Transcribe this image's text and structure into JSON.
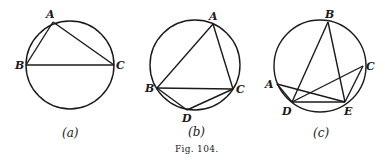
{
  "figure": {
    "caption": "Fig. 104.",
    "panels": [
      {
        "id": "a",
        "sublabel": "(a)",
        "circle": {
          "cx": 70,
          "cy": 65,
          "r": 44
        },
        "points": {
          "A": [
            53,
            22
          ],
          "B": [
            26,
            65
          ],
          "C": [
            114,
            65
          ]
        },
        "labels": {
          "A": "A",
          "B": "B",
          "C": "C"
        },
        "segments": [
          [
            "A",
            "B"
          ],
          [
            "A",
            "C"
          ],
          [
            "B",
            "C"
          ]
        ]
      },
      {
        "id": "b",
        "sublabel": "(b)",
        "circle": {
          "cx": 195,
          "cy": 65,
          "r": 45
        },
        "points": {
          "A": [
            213,
            24
          ],
          "B": [
            157,
            88
          ],
          "C": [
            233,
            89
          ],
          "D": [
            187,
            110
          ]
        },
        "labels": {
          "A": "A",
          "B": "B",
          "C": "C",
          "D": "D"
        },
        "segments": [
          [
            "A",
            "B"
          ],
          [
            "A",
            "C"
          ],
          [
            "B",
            "C"
          ],
          [
            "B",
            "D"
          ],
          [
            "D",
            "C"
          ]
        ]
      },
      {
        "id": "c",
        "sublabel": "(c)",
        "circle": {
          "cx": 320,
          "cy": 66,
          "r": 46
        },
        "points": {
          "A": [
            277,
            84
          ],
          "B": [
            328,
            22
          ],
          "C": [
            363,
            66
          ],
          "D": [
            292,
            102
          ],
          "E": [
            345,
            102
          ]
        },
        "labels": {
          "A": "A",
          "B": "B",
          "C": "C",
          "D": "D",
          "E": "E"
        },
        "segments": [
          [
            "B",
            "D"
          ],
          [
            "B",
            "E"
          ],
          [
            "A",
            "E"
          ],
          [
            "D",
            "C"
          ],
          [
            "D",
            "E"
          ],
          [
            "C",
            "E"
          ],
          [
            "A",
            "D"
          ]
        ]
      }
    ]
  }
}
